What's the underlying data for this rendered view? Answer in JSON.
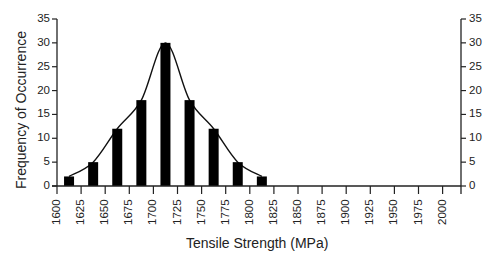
{
  "chart_data": {
    "type": "bar",
    "title": "",
    "xlabel": "Tensile Strength (MPa)",
    "ylabel": "Frequency of Occurrence",
    "x_ticks": [
      "1600",
      "1625",
      "1650",
      "1675",
      "1700",
      "1725",
      "1750",
      "1775",
      "1800",
      "1825",
      "1850",
      "1875",
      "1900",
      "1925",
      "1950",
      "1975",
      "2000"
    ],
    "y_ticks": [
      "0",
      "5",
      "10",
      "15",
      "20",
      "25",
      "30",
      "35"
    ],
    "ylim": [
      0,
      35
    ],
    "xlim": [
      1600,
      2025
    ],
    "bin_width": 25,
    "categories": [
      "1600-1625",
      "1625-1650",
      "1650-1675",
      "1675-1700",
      "1700-1725",
      "1725-1750",
      "1750-1775",
      "1775-1800",
      "1800-1825"
    ],
    "bin_starts": [
      1600,
      1625,
      1650,
      1675,
      1700,
      1725,
      1750,
      1775,
      1800
    ],
    "values": [
      2,
      5,
      12,
      18,
      30,
      18,
      12,
      5,
      2
    ],
    "overlay": {
      "type": "smooth-line",
      "description": "Distribution curve through bar tops"
    },
    "grid": false,
    "secondary_y_axis": true,
    "legend": null,
    "colors": {
      "bars": "#000000",
      "axes": "#222222",
      "curve": "#111111"
    }
  }
}
